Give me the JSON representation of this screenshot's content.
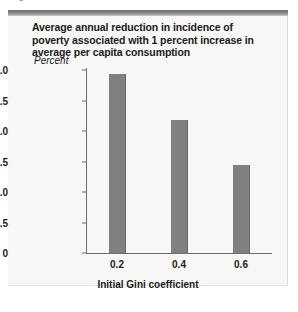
{
  "clipped_caption": {
    "fragment": "Figure"
  },
  "figure": {
    "title": "Average annual reduction in incidence of poverty associated with 1 percent increase in average per capita consumption",
    "accent_color": "#7a7a7a",
    "card_background": "#f7f7f6"
  },
  "chart_data": {
    "type": "bar",
    "title": "Average annual reduction in incidence of poverty associated with 1 percent increase in average per capita consumption",
    "categories": [
      "0.2",
      "0.4",
      "0.6"
    ],
    "values": [
      2.93,
      2.18,
      1.44
    ],
    "xlabel": "Initial Gini coefficient",
    "ylabel": "Percent",
    "ylim": [
      0,
      3.0
    ],
    "yticks": [
      "0",
      "0.5",
      "1.0",
      "1.5",
      "2.0",
      "2.5",
      "3.0"
    ],
    "ytick_values": [
      0,
      0.5,
      1.0,
      1.5,
      2.0,
      2.5,
      3.0
    ],
    "grid": false,
    "legend": "none",
    "bar_color": "#808080"
  }
}
